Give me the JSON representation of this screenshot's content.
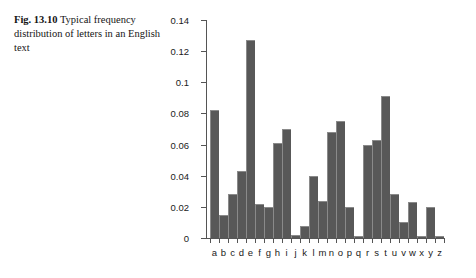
{
  "caption": {
    "figure_number": "Fig. 13.10",
    "text": "Typical frequency distribution of letters in an English text"
  },
  "chart_data": {
    "type": "bar",
    "title": "",
    "xlabel": "",
    "ylabel": "",
    "ylim": [
      0,
      0.14
    ],
    "yticks": [
      "0",
      "0.02",
      "0.04",
      "0.06",
      "0.08",
      "0.1",
      "0.12",
      "0.14"
    ],
    "ytick_values": [
      0,
      0.02,
      0.04,
      0.06,
      0.08,
      0.1,
      0.12,
      0.14
    ],
    "grid": false,
    "legend": "none",
    "bar_color": "#585858",
    "bar_edge_color": "#8a8a8a",
    "axis_color": "#555555",
    "categories": [
      "a",
      "b",
      "c",
      "d",
      "e",
      "f",
      "g",
      "h",
      "i",
      "j",
      "k",
      "l",
      "m",
      "n",
      "o",
      "p",
      "q",
      "r",
      "s",
      "t",
      "u",
      "v",
      "w",
      "x",
      "y",
      "z"
    ],
    "values": [
      0.082,
      0.015,
      0.028,
      0.043,
      0.127,
      0.022,
      0.02,
      0.061,
      0.07,
      0.002,
      0.008,
      0.04,
      0.024,
      0.068,
      0.075,
      0.02,
      0.001,
      0.06,
      0.063,
      0.091,
      0.028,
      0.01,
      0.023,
      0.001,
      0.02,
      0.001
    ]
  }
}
